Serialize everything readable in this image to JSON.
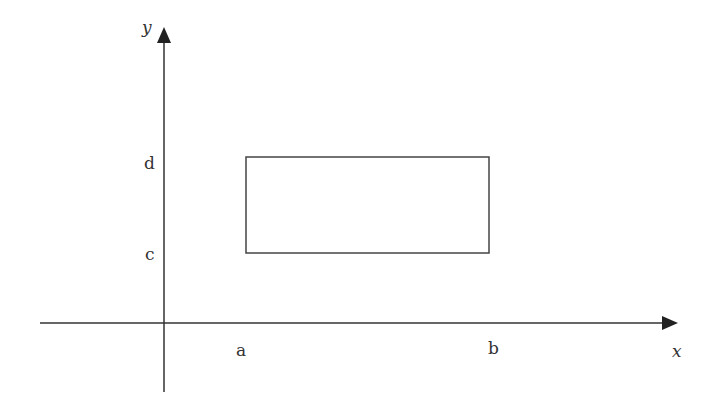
{
  "diagram": {
    "type": "coordinate-rectangle",
    "axes": {
      "x_label": "x",
      "y_label": "y"
    },
    "tick_labels": {
      "x": [
        "a",
        "b"
      ],
      "y": [
        "c",
        "d"
      ]
    },
    "rectangle": {
      "x_from": "a",
      "x_to": "b",
      "y_from": "c",
      "y_to": "d"
    },
    "colors": {
      "stroke": "#333333",
      "background": "#ffffff"
    }
  }
}
